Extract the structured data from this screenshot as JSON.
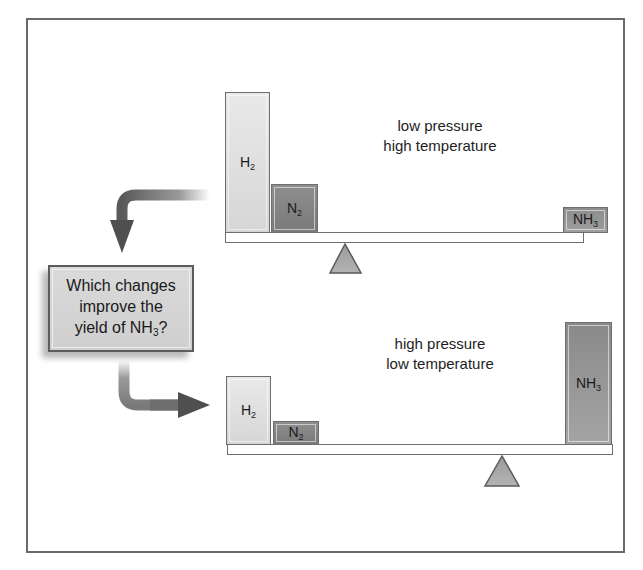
{
  "diagram": {
    "question": {
      "line1": "Which changes",
      "line2": "improve the",
      "line3_prefix": "yield of NH",
      "line3_sub": "3",
      "line3_suffix": "?"
    },
    "top_scale": {
      "conditions": {
        "line1": "low pressure",
        "line2": "high temperature"
      },
      "blocks": [
        {
          "species": "H",
          "subscript": "2",
          "relative_amount": "large"
        },
        {
          "species": "N",
          "subscript": "2",
          "relative_amount": "medium"
        },
        {
          "species": "NH",
          "subscript": "3",
          "relative_amount": "small"
        }
      ],
      "tilt": "reactant side heavy"
    },
    "bottom_scale": {
      "conditions": {
        "line1": "high pressure",
        "line2": "low temperature"
      },
      "blocks": [
        {
          "species": "H",
          "subscript": "2",
          "relative_amount": "medium"
        },
        {
          "species": "N",
          "subscript": "2",
          "relative_amount": "small"
        },
        {
          "species": "NH",
          "subscript": "3",
          "relative_amount": "large"
        }
      ],
      "tilt": "product side heavy"
    },
    "colors": {
      "frame": "#6a6a6a",
      "h2_block": "#e0e0e0",
      "n2_block": "#848484",
      "nh3_block": "#979797",
      "fulcrum": "#a8a8a8",
      "arrow": "#555555",
      "question_box": "#d4d4d4"
    }
  }
}
